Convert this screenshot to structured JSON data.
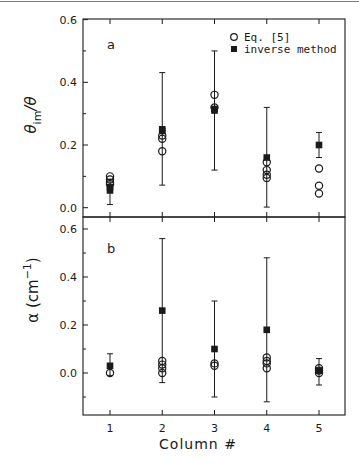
{
  "chart_data": [
    {
      "panel": "a",
      "type": "scatter",
      "title": "",
      "panel_label": "a",
      "xlabel": "Column #",
      "ylabel": "θim/θ",
      "ylabel_main": "θ",
      "ylabel_sub": "im",
      "ylabel_tail": "/θ",
      "x_categories": [
        1,
        2,
        3,
        4,
        5
      ],
      "xlim": [
        0.5,
        5.5
      ],
      "ylim": [
        -0.03,
        0.6
      ],
      "yticks": [
        0.0,
        0.2,
        0.4,
        0.6
      ],
      "ytick_labels": [
        "0.0",
        "0.2",
        "0.4",
        "0.6"
      ],
      "yminor_ticks": [
        0.1,
        0.3,
        0.5
      ],
      "grid": false,
      "legend": {
        "position": "upper right",
        "entries": [
          {
            "marker": "open-circle",
            "label": "Eq. [5]"
          },
          {
            "marker": "filled-square",
            "label": "inverse method"
          }
        ]
      },
      "series": [
        {
          "name": "Eq. [5]",
          "marker": "open-circle",
          "points": [
            {
              "x": 1,
              "y": 0.1
            },
            {
              "x": 1,
              "y": 0.09
            },
            {
              "x": 1,
              "y": 0.08
            },
            {
              "x": 1,
              "y": 0.075
            },
            {
              "x": 2,
              "y": 0.23
            },
            {
              "x": 2,
              "y": 0.22
            },
            {
              "x": 2,
              "y": 0.18
            },
            {
              "x": 3,
              "y": 0.36
            },
            {
              "x": 3,
              "y": 0.32
            },
            {
              "x": 4,
              "y": 0.145
            },
            {
              "x": 4,
              "y": 0.12
            },
            {
              "x": 4,
              "y": 0.105
            },
            {
              "x": 4,
              "y": 0.095
            },
            {
              "x": 5,
              "y": 0.125
            },
            {
              "x": 5,
              "y": 0.07
            },
            {
              "x": 5,
              "y": 0.045
            }
          ]
        },
        {
          "name": "inverse method",
          "marker": "filled-square",
          "points": [
            {
              "x": 1,
              "y": 0.065
            },
            {
              "x": 1,
              "y": 0.055
            },
            {
              "x": 2,
              "y": 0.25
            },
            {
              "x": 2,
              "y": 0.245
            },
            {
              "x": 3,
              "y": 0.315
            },
            {
              "x": 3,
              "y": 0.31
            },
            {
              "x": 4,
              "y": 0.16
            },
            {
              "x": 5,
              "y": 0.2
            }
          ]
        }
      ],
      "error_bars": [
        {
          "x": 1,
          "low": 0.01,
          "high": 0.09
        },
        {
          "x": 2,
          "low": 0.072,
          "high": 0.431
        },
        {
          "x": 3,
          "low": 0.12,
          "high": 0.5
        },
        {
          "x": 4,
          "low": 0.002,
          "high": 0.32
        },
        {
          "x": 5,
          "low": 0.16,
          "high": 0.24
        }
      ]
    },
    {
      "panel": "b",
      "type": "scatter",
      "title": "",
      "panel_label": "b",
      "xlabel": "Column #",
      "ylabel": "α (cm⁻¹)",
      "ylabel_main": "α (cm",
      "ylabel_sup": "−1",
      "ylabel_tail": ")",
      "x_categories": [
        1,
        2,
        3,
        4,
        5
      ],
      "xtick_labels": [
        "1",
        "2",
        "3",
        "4",
        "5"
      ],
      "xlim": [
        0.5,
        5.5
      ],
      "ylim": [
        -0.175,
        0.65
      ],
      "yticks": [
        0.0,
        0.2,
        0.4,
        0.6
      ],
      "ytick_labels": [
        "0.0",
        "0.2",
        "0.4",
        "0.6"
      ],
      "yminor_ticks": [
        -0.1,
        0.1,
        0.3,
        0.5
      ],
      "grid": false,
      "series": [
        {
          "name": "Eq. [5]",
          "marker": "open-circle",
          "points": [
            {
              "x": 1,
              "y": 0.0
            },
            {
              "x": 2,
              "y": 0.05
            },
            {
              "x": 2,
              "y": 0.035
            },
            {
              "x": 2,
              "y": 0.02
            },
            {
              "x": 2,
              "y": 0.0
            },
            {
              "x": 3,
              "y": 0.04
            },
            {
              "x": 3,
              "y": 0.03
            },
            {
              "x": 4,
              "y": 0.065
            },
            {
              "x": 4,
              "y": 0.05
            },
            {
              "x": 4,
              "y": 0.04
            },
            {
              "x": 4,
              "y": 0.02
            },
            {
              "x": 5,
              "y": 0.02
            },
            {
              "x": 5,
              "y": 0.01
            },
            {
              "x": 5,
              "y": 0.0
            }
          ]
        },
        {
          "name": "inverse method",
          "marker": "filled-square",
          "points": [
            {
              "x": 1,
              "y": 0.03
            },
            {
              "x": 2,
              "y": 0.26
            },
            {
              "x": 3,
              "y": 0.1
            },
            {
              "x": 4,
              "y": 0.18
            },
            {
              "x": 5,
              "y": 0.01
            }
          ]
        }
      ],
      "error_bars": [
        {
          "x": 1,
          "low": -0.01,
          "high": 0.08
        },
        {
          "x": 2,
          "low": -0.04,
          "high": 0.56
        },
        {
          "x": 3,
          "low": -0.1,
          "high": 0.3
        },
        {
          "x": 4,
          "low": -0.12,
          "high": 0.48
        },
        {
          "x": 5,
          "low": -0.05,
          "high": 0.06
        }
      ]
    }
  ],
  "figure": {
    "xlabel": "Column #",
    "legend": {
      "circle_label": "Eq. [5]",
      "square_label": "inverse method"
    },
    "colors": {
      "ink": "#1a1a1a",
      "background": "#ffffff"
    }
  }
}
